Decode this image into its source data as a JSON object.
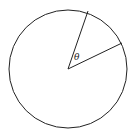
{
  "diagram": {
    "type": "circle-sector",
    "circle": {
      "cx": 68,
      "cy": 69,
      "r": 59,
      "stroke": "#222222"
    },
    "radii": [
      {
        "x2": 88,
        "y2": 11
      },
      {
        "x2": 122,
        "y2": 43
      }
    ],
    "angle_label": "θ"
  }
}
